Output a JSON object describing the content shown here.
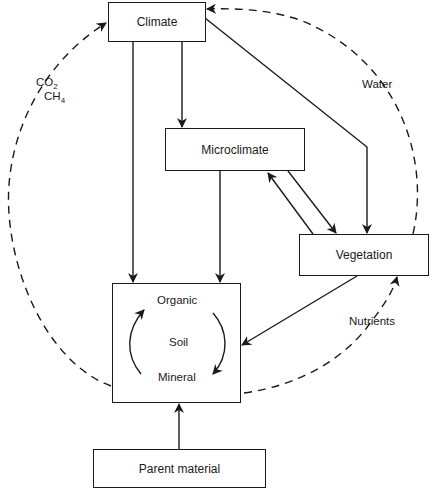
{
  "diagram": {
    "nodes": {
      "climate": "Climate",
      "microclimate": "Microclimate",
      "vegetation": "Vegetation",
      "soil": "Soil",
      "soil_organic": "Organic",
      "soil_mineral": "Mineral",
      "parent_material": "Parent material"
    },
    "edge_labels": {
      "co2": "CO",
      "co2_sub": "2",
      "ch4": "CH",
      "ch4_sub": "4",
      "water": "Water",
      "nutrients": "Nutrients"
    },
    "edges": [
      {
        "from": "Climate",
        "to": "Soil",
        "style": "solid"
      },
      {
        "from": "Climate",
        "to": "Microclimate",
        "style": "solid"
      },
      {
        "from": "Climate",
        "to": "Vegetation",
        "style": "solid"
      },
      {
        "from": "Microclimate",
        "to": "Soil",
        "style": "solid"
      },
      {
        "from": "Microclimate",
        "to": "Vegetation",
        "style": "solid"
      },
      {
        "from": "Vegetation",
        "to": "Microclimate",
        "style": "solid"
      },
      {
        "from": "Vegetation",
        "to": "Soil",
        "style": "solid"
      },
      {
        "from": "Parent material",
        "to": "Soil",
        "style": "solid"
      },
      {
        "from": "Soil",
        "to": "Climate",
        "style": "dashed",
        "label": "CO2 CH4"
      },
      {
        "from": "Vegetation",
        "to": "Climate",
        "style": "dashed",
        "label": "Water"
      },
      {
        "from": "Soil",
        "to": "Vegetation",
        "style": "dashed",
        "label": "Nutrients"
      },
      {
        "from": "Organic",
        "to": "Mineral",
        "style": "curved"
      },
      {
        "from": "Mineral",
        "to": "Organic",
        "style": "curved"
      }
    ]
  }
}
